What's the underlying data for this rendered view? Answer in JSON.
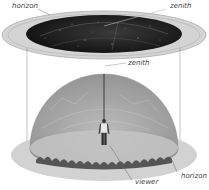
{
  "diagram": {
    "type": "celestial-sphere",
    "labels": {
      "top_horizon": "horizon",
      "top_zenith": "zenith",
      "dome_zenith": "zenith",
      "viewer": "viewer",
      "bottom_horizon": "horizon"
    },
    "colors": {
      "background": "#ffffff",
      "sky_disk": "#1e1e1e",
      "disk_rim": "#c8c8c8",
      "dome_fill": "#a9a9a9",
      "ground": "#cfcfcf",
      "trees": "#555555",
      "lines": "#666666",
      "text": "#444444"
    }
  }
}
